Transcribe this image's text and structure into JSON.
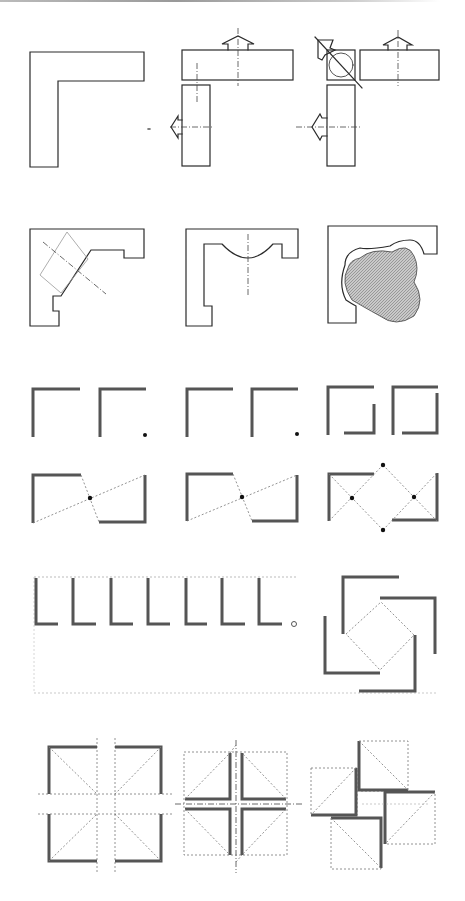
{
  "sheet": {
    "title": "L-shaped plan form variations",
    "rows": [
      {
        "id": "row-1",
        "figures": [
          "solid-L",
          "split-L-with-entry-arrows",
          "split-L-with-corner-node"
        ]
      },
      {
        "id": "row-2",
        "figures": [
          "L-with-diagonal-corner",
          "L-with-curved-inner-edge",
          "L-with-organic-courtyard"
        ]
      },
      {
        "id": "row-3",
        "figures": [
          "two-L-walls-open",
          "two-L-walls-with-point",
          "interlocking-L-walls"
        ]
      },
      {
        "id": "row-4",
        "figures": [
          "opposed-L-central-point",
          "opposed-L-central-point-2",
          "opposed-L-double-diamond"
        ]
      },
      {
        "id": "row-5",
        "figures": [
          "repeated-L-series",
          "pinwheel-L-around-square"
        ]
      },
      {
        "id": "row-6",
        "figures": [
          "four-L-quadrants",
          "four-L-cross-axis",
          "rotated-L-pinwheel"
        ]
      }
    ],
    "colors": {
      "ink": "#2a2a2a",
      "wall": "#555555",
      "guide": "#777777",
      "hatch": "#8a8a8a"
    }
  }
}
